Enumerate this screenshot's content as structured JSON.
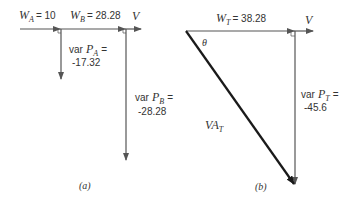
{
  "diagram": {
    "type": "phasor power triangle diagrams",
    "panel_a": {
      "caption": "(a)",
      "reference_label": "V",
      "w_a": {
        "symbol": "W",
        "subscript": "A",
        "value_text": "= 10"
      },
      "w_b": {
        "symbol": "W",
        "subscript": "B",
        "value_text": "= 28.28"
      },
      "var_a": {
        "prefix": "var",
        "symbol": "P",
        "subscript": "A",
        "eq": "=",
        "value": "-17.32"
      },
      "var_b": {
        "prefix": "var",
        "symbol": "P",
        "subscript": "B",
        "eq": "=",
        "value": "-28.28"
      }
    },
    "panel_b": {
      "caption": "(b)",
      "reference_label": "V",
      "w_t": {
        "symbol": "W",
        "subscript": "T",
        "value_text": "= 38.28"
      },
      "var_t": {
        "prefix": "var",
        "symbol": "P",
        "subscript": "T",
        "eq": "=",
        "value": "-45.6"
      },
      "va_t": {
        "symbol": "VA",
        "subscript": "T"
      },
      "angle": "θ"
    },
    "colors": {
      "line": "#555555",
      "heavy": "#1a1a1a",
      "text": "#333333"
    }
  }
}
